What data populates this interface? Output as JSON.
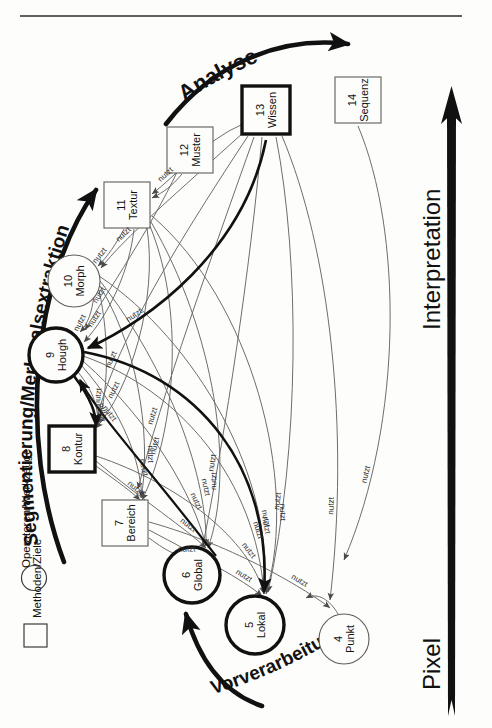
{
  "figure": {
    "type": "diagram",
    "orientation_note": "page rotated 90 degrees counter-clockwise",
    "axis": {
      "low_label": "Pixel",
      "high_label": "Interpretation",
      "direction": "arrow pointing from Pixel to Interpretation"
    },
    "stage_arcs": [
      {
        "id": "arc-vorverarbeitung",
        "label": "Vorverarbeitung"
      },
      {
        "id": "arc-segmentierung",
        "label": "Segmentierung/Merkmalsextraktion"
      },
      {
        "id": "arc-analyse",
        "label": "Analyse"
      }
    ],
    "legend": {
      "items": [
        {
          "shape": "circle",
          "label": "Operatoren/Werkzeuge"
        },
        {
          "shape": "square",
          "label": "Methoden/Ziele"
        }
      ]
    },
    "edge_label": "nutzt",
    "nodes": [
      {
        "num": "4",
        "label": "Punkt",
        "shape": "circle",
        "emphasis": "thin",
        "cx": 344,
        "cy": 639,
        "r": 25
      },
      {
        "num": "5",
        "label": "Lokal",
        "shape": "circle",
        "emphasis": "bold",
        "cx": 255,
        "cy": 625,
        "r": 29
      },
      {
        "num": "6",
        "label": "Global",
        "shape": "circle",
        "emphasis": "bold",
        "cx": 192,
        "cy": 575,
        "r": 28
      },
      {
        "num": "7",
        "label": "Bereich",
        "shape": "square",
        "emphasis": "thin",
        "cx": 125,
        "cy": 523,
        "w": 46,
        "h": 46
      },
      {
        "num": "8",
        "label": "Kontur",
        "shape": "square",
        "emphasis": "bold",
        "cx": 72,
        "cy": 449,
        "w": 46,
        "h": 46
      },
      {
        "num": "9",
        "label": "Hough",
        "shape": "circle",
        "emphasis": "bold",
        "cx": 56,
        "cy": 355,
        "r": 27
      },
      {
        "num": "10",
        "label": "Morph",
        "shape": "circle",
        "emphasis": "thin",
        "cx": 74,
        "cy": 281,
        "r": 26
      },
      {
        "num": "11",
        "label": "Textur",
        "shape": "square",
        "emphasis": "thin",
        "cx": 127,
        "cy": 205,
        "w": 46,
        "h": 46
      },
      {
        "num": "12",
        "label": "Muster",
        "shape": "square",
        "emphasis": "thin",
        "cx": 190,
        "cy": 150,
        "w": 46,
        "h": 46
      },
      {
        "num": "13",
        "label": "Wissen",
        "shape": "square",
        "emphasis": "bold",
        "cx": 266,
        "cy": 110,
        "w": 48,
        "h": 48
      },
      {
        "num": "14",
        "label": "Sequenz",
        "shape": "square",
        "emphasis": "thin",
        "cx": 358,
        "cy": 100,
        "w": 46,
        "h": 46
      }
    ],
    "colors": {
      "ink": "#111111",
      "paper": "#fdfdfb",
      "thin_stroke": "#5a5a5a",
      "ghost_text": "#c9c6c0"
    }
  },
  "page_bleed": {
    "lines_left": [
      "",
      "",
      "",
      "",
      "",
      "",
      "",
      "",
      "",
      "",
      "",
      ""
    ]
  }
}
